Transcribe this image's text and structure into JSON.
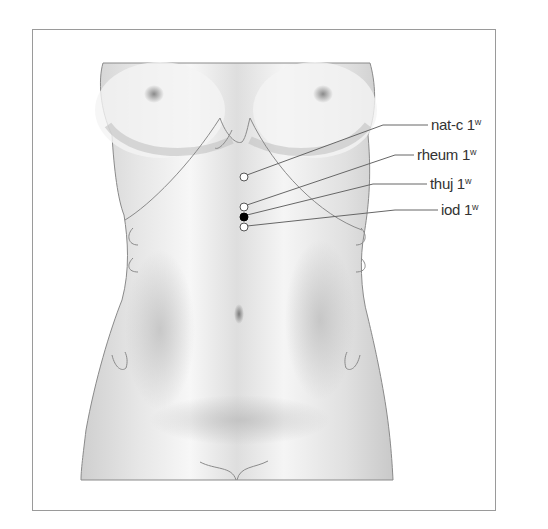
{
  "figure": {
    "title": "",
    "points": [
      {
        "label": "nat-c",
        "dose": "1",
        "unit": "w",
        "x": 244,
        "y": 177,
        "fill": "#ffffff"
      },
      {
        "label": "rheum",
        "dose": "1",
        "unit": "w",
        "x": 244,
        "y": 207,
        "fill": "#ffffff"
      },
      {
        "label": "thuj",
        "dose": "1",
        "unit": "w",
        "x": 244,
        "y": 217,
        "fill": "#000000"
      },
      {
        "label": "iod",
        "dose": "1",
        "unit": "w",
        "x": 244,
        "y": 227,
        "fill": "#ffffff"
      }
    ]
  },
  "labels": {
    "natc": {
      "name": "nat-c 1",
      "sup": "w"
    },
    "rheum": {
      "name": "rheum 1",
      "sup": "w"
    },
    "thuj": {
      "name": "thuj 1",
      "sup": "w"
    },
    "iod": {
      "name": "iod 1",
      "sup": "w"
    }
  },
  "colors": {
    "frame": "#9a9a9a",
    "outline": "#8a8a8a",
    "leader": "#666666"
  }
}
